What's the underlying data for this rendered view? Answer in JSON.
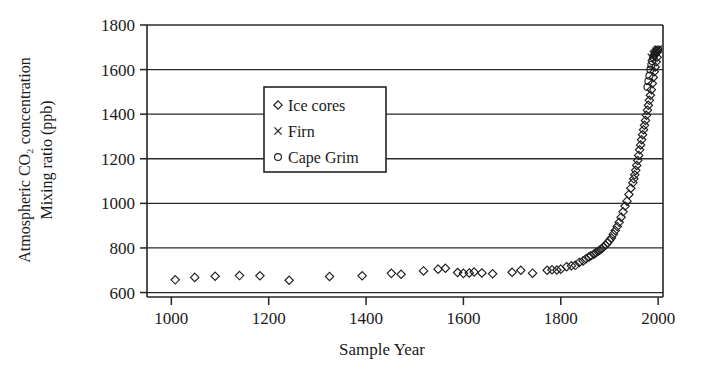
{
  "chart_data": {
    "type": "scatter",
    "title": "",
    "xlabel": "Sample Year",
    "ylabel_line1": "Atmospheric CO₂ concentration",
    "ylabel_line2": "Mixing ratio (ppb)",
    "xlim": [
      950,
      2010
    ],
    "ylim": [
      580,
      1800
    ],
    "xticks": [
      1000,
      1200,
      1400,
      1600,
      1800,
      2000
    ],
    "yticks": [
      600,
      800,
      1000,
      1200,
      1400,
      1600,
      1800
    ],
    "grid": "horizontal",
    "legend_position": "upper-center-left",
    "legend": [
      {
        "label": "Ice cores",
        "marker": "diamond"
      },
      {
        "label": "Firn",
        "marker": "cross"
      },
      {
        "label": "Cape Grim",
        "marker": "circle"
      }
    ],
    "series": [
      {
        "name": "Ice cores",
        "marker": "diamond",
        "points": [
          [
            1008,
            657
          ],
          [
            1048,
            668
          ],
          [
            1090,
            673
          ],
          [
            1140,
            676
          ],
          [
            1182,
            675
          ],
          [
            1242,
            655
          ],
          [
            1325,
            672
          ],
          [
            1392,
            675
          ],
          [
            1452,
            686
          ],
          [
            1472,
            682
          ],
          [
            1518,
            697
          ],
          [
            1548,
            705
          ],
          [
            1563,
            709
          ],
          [
            1588,
            690
          ],
          [
            1600,
            686
          ],
          [
            1612,
            688
          ],
          [
            1622,
            692
          ],
          [
            1638,
            688
          ],
          [
            1660,
            684
          ],
          [
            1700,
            691
          ],
          [
            1718,
            700
          ],
          [
            1742,
            687
          ],
          [
            1772,
            700
          ],
          [
            1782,
            702
          ],
          [
            1792,
            701
          ],
          [
            1800,
            705
          ],
          [
            1812,
            716
          ],
          [
            1822,
            720
          ],
          [
            1830,
            722
          ],
          [
            1838,
            735
          ],
          [
            1846,
            742
          ],
          [
            1852,
            752
          ],
          [
            1858,
            760
          ],
          [
            1862,
            765
          ],
          [
            1868,
            772
          ],
          [
            1872,
            778
          ],
          [
            1876,
            784
          ],
          [
            1880,
            790
          ],
          [
            1884,
            796
          ],
          [
            1888,
            805
          ],
          [
            1892,
            812
          ],
          [
            1896,
            822
          ],
          [
            1900,
            833
          ],
          [
            1904,
            845
          ],
          [
            1908,
            862
          ],
          [
            1912,
            878
          ],
          [
            1916,
            896
          ],
          [
            1920,
            915
          ],
          [
            1924,
            938
          ],
          [
            1928,
            962
          ],
          [
            1932,
            988
          ],
          [
            1936,
            1010
          ],
          [
            1940,
            1040
          ],
          [
            1944,
            1068
          ],
          [
            1948,
            1092
          ],
          [
            1950,
            1110
          ],
          [
            1952,
            1128
          ],
          [
            1954,
            1148
          ],
          [
            1956,
            1170
          ],
          [
            1958,
            1192
          ],
          [
            1960,
            1215
          ],
          [
            1962,
            1240
          ],
          [
            1964,
            1262
          ],
          [
            1966,
            1285
          ],
          [
            1968,
            1308
          ],
          [
            1970,
            1330
          ],
          [
            1972,
            1350
          ],
          [
            1974,
            1372
          ],
          [
            1976,
            1395
          ],
          [
            1978,
            1418
          ],
          [
            1980,
            1440
          ],
          [
            1982,
            1462
          ],
          [
            1984,
            1485
          ],
          [
            1986,
            1510
          ],
          [
            1988,
            1538
          ],
          [
            1990,
            1565
          ],
          [
            1992,
            1590
          ],
          [
            1994,
            1612
          ],
          [
            1996,
            1635
          ],
          [
            1998,
            1655
          ]
        ]
      },
      {
        "name": "Firn",
        "marker": "cross",
        "points": [
          [
            1986,
            1655
          ],
          [
            1990,
            1668
          ],
          [
            1992,
            1672
          ],
          [
            1994,
            1678
          ],
          [
            1996,
            1683
          ],
          [
            1998,
            1688
          ],
          [
            2000,
            1692
          ]
        ]
      },
      {
        "name": "Cape Grim",
        "marker": "circle",
        "points": [
          [
            1978,
            1522
          ],
          [
            1980,
            1548
          ],
          [
            1982,
            1572
          ],
          [
            1984,
            1600
          ],
          [
            1986,
            1622
          ],
          [
            1988,
            1638
          ],
          [
            1990,
            1655
          ],
          [
            1992,
            1665
          ],
          [
            1994,
            1672
          ],
          [
            1996,
            1678
          ],
          [
            1998,
            1684
          ],
          [
            2000,
            1690
          ]
        ]
      }
    ]
  }
}
